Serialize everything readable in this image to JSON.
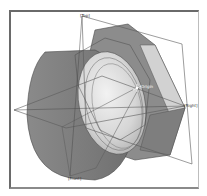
{
  "viewport": {
    "type": "3d-cad-view",
    "model": "hex-fitting",
    "planes": [
      {
        "name": "top-plane",
        "label": "[Top]"
      },
      {
        "name": "right-plane",
        "label": "[Right]"
      },
      {
        "name": "front-plane",
        "label": "[Front]"
      }
    ],
    "origin_label": "Origin",
    "colors": {
      "body_dark": "#7d7d7d",
      "body_mid": "#9a9a9a",
      "face_light": "#d9d9d9",
      "edge": "#3f3f3f",
      "plane_line": "#5a5a5a"
    }
  }
}
